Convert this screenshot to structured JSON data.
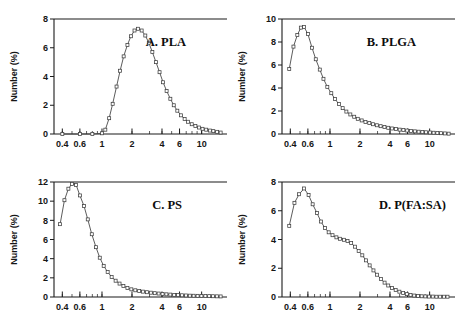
{
  "figure": {
    "caption_present": false,
    "panel_count": 4,
    "marker_style": "open-square",
    "line_color": "#4a4a4a",
    "axis_color": "#1a1a1a",
    "background": "#ffffff"
  },
  "axis_common": {
    "ylabel": "Number (%)",
    "xscale": "log",
    "xticks": [
      0.4,
      0.6,
      1,
      2,
      4,
      6,
      10
    ],
    "xticklabels": [
      "0.4",
      "0.6",
      "1",
      "2",
      "4",
      "6",
      "10"
    ],
    "xlim": [
      0.33,
      16
    ],
    "grid": false,
    "legend": "none"
  },
  "chart_data": [
    {
      "id": "panel-a",
      "type": "line",
      "title": "A. PLA",
      "xlabel": "",
      "ylabel": "Number (%)",
      "xscale": "log",
      "xlim": [
        0.33,
        16
      ],
      "ylim": [
        0,
        8
      ],
      "yticks": [
        0,
        2,
        4,
        6,
        8
      ],
      "yticklabels": [
        "0",
        "2",
        "4",
        "6",
        "8"
      ],
      "xticks": [
        0.4,
        0.6,
        1,
        2,
        4,
        6,
        10
      ],
      "xticklabels": [
        "0.4",
        "0.6",
        "1",
        "2",
        "4",
        "6",
        "10"
      ],
      "peak_value": 7.3,
      "peak_x": 2.3,
      "x": [
        0.4,
        0.6,
        0.8,
        1.0,
        1.08,
        1.18,
        1.28,
        1.4,
        1.52,
        1.65,
        1.8,
        1.95,
        2.12,
        2.3,
        2.5,
        2.72,
        2.95,
        3.2,
        3.48,
        3.78,
        4.1,
        4.45,
        4.85,
        5.25,
        5.7,
        6.2,
        6.75,
        7.3,
        7.95,
        8.65,
        9.4,
        10.2,
        11.1,
        12.1,
        13.1,
        14.3,
        15.5
      ],
      "y": [
        0.0,
        0.0,
        0.0,
        0.05,
        0.3,
        1.1,
        2.1,
        3.3,
        4.4,
        5.4,
        6.2,
        6.8,
        7.2,
        7.32,
        7.2,
        6.85,
        6.35,
        5.7,
        5.0,
        4.3,
        3.6,
        3.0,
        2.45,
        2.0,
        1.62,
        1.3,
        1.05,
        0.85,
        0.68,
        0.55,
        0.45,
        0.36,
        0.3,
        0.24,
        0.2,
        0.15,
        0.1
      ]
    },
    {
      "id": "panel-b",
      "type": "line",
      "title": "B. PLGA",
      "xlabel": "",
      "ylabel": "Number (%)",
      "xscale": "log",
      "xlim": [
        0.33,
        16
      ],
      "ylim": [
        0,
        10
      ],
      "yticks": [
        0,
        2,
        4,
        6,
        8,
        10
      ],
      "yticklabels": [
        "0",
        "2",
        "4",
        "6",
        "8",
        "10"
      ],
      "xticks": [
        0.4,
        0.6,
        1,
        2,
        4,
        6,
        10
      ],
      "xticklabels": [
        "0.4",
        "0.6",
        "1",
        "2",
        "4",
        "6",
        "10"
      ],
      "peak_value": 9.3,
      "peak_x": 0.55,
      "x": [
        0.39,
        0.43,
        0.47,
        0.51,
        0.55,
        0.6,
        0.66,
        0.72,
        0.79,
        0.86,
        0.94,
        1.03,
        1.12,
        1.23,
        1.34,
        1.46,
        1.6,
        1.75,
        1.9,
        2.08,
        2.27,
        2.48,
        2.7,
        2.95,
        3.22,
        3.52,
        3.84,
        4.19,
        4.58,
        5.0,
        5.45,
        5.95,
        6.5,
        7.1,
        7.75,
        8.45,
        9.2,
        10.05,
        10.95,
        11.95,
        13.0,
        14.2,
        15.5
      ],
      "y": [
        5.65,
        7.6,
        8.6,
        9.25,
        9.3,
        8.7,
        7.5,
        6.5,
        5.6,
        4.8,
        4.1,
        3.55,
        3.05,
        2.6,
        2.25,
        1.95,
        1.7,
        1.5,
        1.32,
        1.18,
        1.05,
        0.95,
        0.85,
        0.76,
        0.68,
        0.6,
        0.54,
        0.48,
        0.43,
        0.38,
        0.34,
        0.3,
        0.26,
        0.23,
        0.2,
        0.17,
        0.15,
        0.13,
        0.11,
        0.09,
        0.07,
        0.05,
        0.03
      ]
    },
    {
      "id": "panel-c",
      "type": "line",
      "title": "C. PS",
      "xlabel": "",
      "ylabel": "Number (%)",
      "xscale": "log",
      "xlim": [
        0.33,
        16
      ],
      "ylim": [
        0,
        12
      ],
      "yticks": [
        0,
        2,
        4,
        6,
        8,
        10,
        12
      ],
      "yticklabels": [
        "0",
        "2",
        "4",
        "6",
        "8",
        "10",
        "12"
      ],
      "xticks": [
        0.4,
        0.6,
        1,
        2,
        4,
        6,
        10
      ],
      "xticklabels": [
        "0.4",
        "0.6",
        "1",
        "2",
        "4",
        "6",
        "10"
      ],
      "peak_value": 11.8,
      "peak_x": 0.55,
      "x": [
        0.38,
        0.42,
        0.46,
        0.5,
        0.55,
        0.6,
        0.66,
        0.72,
        0.79,
        0.87,
        0.95,
        1.04,
        1.14,
        1.25,
        1.37,
        1.5,
        1.64,
        1.8,
        1.97,
        2.16,
        2.36,
        2.58,
        2.82,
        3.09,
        3.38,
        3.7,
        4.05,
        4.43,
        4.85,
        5.3,
        5.8,
        6.35,
        6.95,
        7.6,
        8.3,
        9.1,
        9.95,
        10.9,
        11.9,
        13.0,
        14.2,
        15.5
      ],
      "y": [
        7.6,
        10.1,
        11.3,
        11.8,
        11.7,
        10.6,
        9.5,
        8.1,
        6.55,
        5.2,
        4.1,
        3.25,
        2.6,
        2.1,
        1.7,
        1.4,
        1.15,
        0.95,
        0.8,
        0.7,
        0.62,
        0.56,
        0.5,
        0.45,
        0.4,
        0.36,
        0.32,
        0.28,
        0.25,
        0.22,
        0.2,
        0.18,
        0.16,
        0.14,
        0.13,
        0.12,
        0.11,
        0.1,
        0.09,
        0.08,
        0.07,
        0.06
      ]
    },
    {
      "id": "panel-d",
      "type": "line",
      "title": "D. P(FA:SA)",
      "xlabel": "",
      "ylabel": "Number (%)",
      "xscale": "log",
      "xlim": [
        0.33,
        16
      ],
      "ylim": [
        0,
        8
      ],
      "yticks": [
        0,
        2,
        4,
        6,
        8
      ],
      "yticklabels": [
        "0",
        "2",
        "4",
        "6",
        "8"
      ],
      "xticks": [
        0.4,
        0.6,
        1,
        2,
        4,
        6,
        10
      ],
      "xticklabels": [
        "0.4",
        "0.6",
        "1",
        "2",
        "4",
        "6",
        "10"
      ],
      "peak_value": 7.55,
      "peak_x": 0.55,
      "shoulder_x": 1.5,
      "shoulder_value": 3.9,
      "x": [
        0.39,
        0.44,
        0.49,
        0.55,
        0.61,
        0.67,
        0.74,
        0.81,
        0.89,
        0.97,
        1.06,
        1.16,
        1.26,
        1.38,
        1.5,
        1.63,
        1.78,
        1.94,
        2.11,
        2.3,
        2.5,
        2.73,
        2.97,
        3.24,
        3.53,
        3.84,
        4.19,
        4.56,
        4.97,
        5.42,
        5.9,
        6.43,
        7.0,
        7.63,
        8.31,
        9.05,
        9.86,
        10.74,
        11.7,
        12.75,
        13.9,
        15.1
      ],
      "y": [
        4.95,
        6.55,
        7.15,
        7.55,
        7.1,
        6.45,
        5.85,
        5.25,
        4.8,
        4.5,
        4.3,
        4.15,
        4.05,
        3.98,
        3.9,
        3.75,
        3.5,
        3.2,
        2.9,
        2.55,
        2.2,
        1.85,
        1.55,
        1.25,
        1.0,
        0.8,
        0.62,
        0.48,
        0.37,
        0.28,
        0.2,
        0.14,
        0.1,
        0.07,
        0.05,
        0.04,
        0.03,
        0.03,
        0.02,
        0.02,
        0.02,
        0.02
      ]
    }
  ]
}
